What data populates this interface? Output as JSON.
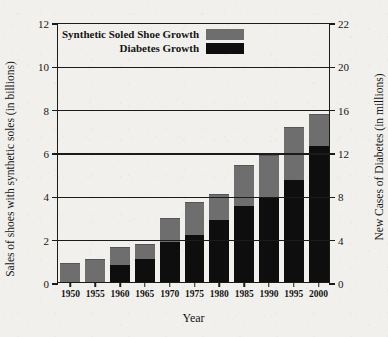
{
  "chart_data": {
    "type": "bar",
    "title": "",
    "subtitle": "",
    "xlabel": "Year",
    "ylabel": "Sales of shoes with synthetic soles (in billions)",
    "ylabel_right": "New Cases of Diabetes (in millions)",
    "categories": [
      "1950",
      "1955",
      "1960",
      "1965",
      "1970",
      "1975",
      "1980",
      "1985",
      "1990",
      "1995",
      "2000"
    ],
    "series": [
      {
        "name": "Synthetic Soled Shoe Growth",
        "color": "#6e6e6e",
        "axis": "left",
        "unit": "billions",
        "values": [
          0.85,
          1.0,
          1.55,
          1.7,
          2.9,
          3.65,
          4.0,
          5.35,
          5.8,
          7.1,
          7.7
        ]
      },
      {
        "name": "Diabetes Growth",
        "color": "#0e0e0e",
        "axis": "right",
        "unit": "millions",
        "values": [
          0,
          0,
          1.6,
          2.1,
          3.7,
          4.3,
          5.7,
          7.0,
          7.8,
          9.4,
          12.6
        ]
      }
    ],
    "ylim": [
      0,
      12
    ],
    "yticks": [
      0,
      2,
      4,
      6,
      8,
      10,
      12
    ],
    "ylim_right": [
      0,
      22
    ],
    "yticks_right": [
      0,
      4,
      8,
      12,
      16,
      20,
      22
    ],
    "grid": true,
    "legend_position": "top-left",
    "legend": [
      {
        "label": "Synthetic Soled Shoe Growth",
        "swatch": "#6e6e6e"
      },
      {
        "label": "Diabetes Growth",
        "swatch": "#0e0e0e"
      }
    ]
  },
  "axes": {
    "left_ticks": [
      "0",
      "2",
      "4",
      "6",
      "8",
      "10",
      "12"
    ],
    "right_ticks": [
      "0",
      "4",
      "8",
      "12",
      "16",
      "20",
      "22"
    ],
    "x_ticks": [
      "1950",
      "1955",
      "1960",
      "1965",
      "1970",
      "1975",
      "1980",
      "1985",
      "1990",
      "1995",
      "2000"
    ],
    "left_title": "Sales of shoes with synthetic soles (in billions)",
    "right_title": "New Cases of Diabetes (in millions)",
    "x_title": "Year"
  },
  "legend": {
    "row1_label": "Synthetic Soled Shoe Growth",
    "row2_label": "Diabetes Growth"
  }
}
